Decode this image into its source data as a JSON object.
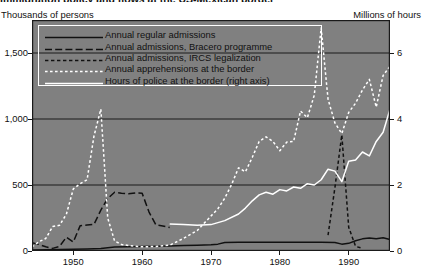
{
  "figure": {
    "title_partial": "Immigration policy and flows at the US-Mexican border",
    "left_axis_caption": "Thousands of persons",
    "right_axis_caption": "Millions of hours",
    "plot_background": "#808080",
    "gridline_color": "#1a1a1a",
    "frame_color": "#1a1a1a"
  },
  "legend": {
    "border_color": "#ffffff",
    "items": [
      {
        "label": "Annual regular admissions",
        "style": "solid",
        "color": "#111111",
        "width": 1.6
      },
      {
        "label": "Annual admissions, Bracero programme",
        "style": "long-dash",
        "color": "#111111",
        "width": 1.6
      },
      {
        "label": "Annual admissions, IRCS legalization",
        "style": "short-dash",
        "color": "#111111",
        "width": 1.6
      },
      {
        "label": "Annual apprehensions at the border",
        "style": "dotted",
        "color": "#ffffff",
        "width": 1.6
      },
      {
        "label": "Hours of police at the border (right axis)",
        "style": "solid",
        "color": "#ffffff",
        "width": 1.6
      }
    ]
  },
  "chart_data": {
    "type": "line",
    "title": "Immigration policy and flows at the US-Mexican border",
    "xlabel": "",
    "ylabel": "Thousands of persons",
    "y2label": "Millions of hours",
    "xlim": [
      1944,
      1996
    ],
    "ylim": [
      0,
      1750
    ],
    "y2lim": [
      0,
      7
    ],
    "grid": true,
    "legend_position": "top-left-inside",
    "xticks": [
      1950,
      1960,
      1970,
      1980,
      1990
    ],
    "xtick_labels": [
      "1950",
      "1960",
      "1970",
      "1980",
      "1990"
    ],
    "yticks": [
      0,
      500,
      1000,
      1500
    ],
    "ytick_labels": [
      "0",
      "500",
      "1,000",
      "1,500"
    ],
    "y2ticks": [
      0,
      2,
      4,
      6
    ],
    "y2tick_labels": [
      "0",
      "2",
      "4",
      "6"
    ],
    "series": [
      {
        "name": "Annual regular admissions",
        "axis": "left",
        "style": "solid",
        "color": "#111111",
        "points": [
          [
            1944,
            8
          ],
          [
            1946,
            10
          ],
          [
            1948,
            12
          ],
          [
            1950,
            14
          ],
          [
            1952,
            16
          ],
          [
            1954,
            18
          ],
          [
            1956,
            30
          ],
          [
            1958,
            32
          ],
          [
            1960,
            34
          ],
          [
            1962,
            36
          ],
          [
            1964,
            38
          ],
          [
            1966,
            42
          ],
          [
            1968,
            44
          ],
          [
            1970,
            48
          ],
          [
            1971,
            52
          ],
          [
            1972,
            64
          ],
          [
            1974,
            66
          ],
          [
            1976,
            66
          ],
          [
            1978,
            66
          ],
          [
            1980,
            66
          ],
          [
            1982,
            66
          ],
          [
            1984,
            66
          ],
          [
            1986,
            66
          ],
          [
            1988,
            64
          ],
          [
            1989,
            52
          ],
          [
            1990,
            58
          ],
          [
            1991,
            78
          ],
          [
            1992,
            92
          ],
          [
            1993,
            98
          ],
          [
            1994,
            92
          ],
          [
            1995,
            100
          ],
          [
            1996,
            86
          ]
        ]
      },
      {
        "name": "Annual admissions, Bracero programme",
        "axis": "left",
        "style": "long-dash",
        "color": "#111111",
        "points": [
          [
            1944,
            62
          ],
          [
            1945,
            50
          ],
          [
            1946,
            32
          ],
          [
            1947,
            20
          ],
          [
            1948,
            35
          ],
          [
            1949,
            105
          ],
          [
            1950,
            68
          ],
          [
            1951,
            192
          ],
          [
            1952,
            197
          ],
          [
            1953,
            201
          ],
          [
            1954,
            310
          ],
          [
            1955,
            398
          ],
          [
            1956,
            445
          ],
          [
            1957,
            437
          ],
          [
            1958,
            433
          ],
          [
            1959,
            440
          ],
          [
            1960,
            437
          ],
          [
            1961,
            295
          ],
          [
            1962,
            198
          ],
          [
            1963,
            190
          ],
          [
            1964,
            178
          ]
        ]
      },
      {
        "name": "Annual admissions, IRCS legalization",
        "axis": "left",
        "style": "short-dash",
        "color": "#111111",
        "points": [
          [
            1987,
            120
          ],
          [
            1988,
            480
          ],
          [
            1989,
            880
          ],
          [
            1990,
            180
          ],
          [
            1991,
            35
          ],
          [
            1992,
            20
          ]
        ]
      },
      {
        "name": "Annual apprehensions at the border",
        "axis": "left",
        "style": "dotted",
        "color": "#ffffff",
        "points": [
          [
            1944,
            30
          ],
          [
            1945,
            70
          ],
          [
            1946,
            95
          ],
          [
            1947,
            185
          ],
          [
            1948,
            195
          ],
          [
            1949,
            280
          ],
          [
            1950,
            470
          ],
          [
            1951,
            510
          ],
          [
            1952,
            540
          ],
          [
            1953,
            870
          ],
          [
            1954,
            1075
          ],
          [
            1955,
            250
          ],
          [
            1956,
            75
          ],
          [
            1957,
            50
          ],
          [
            1958,
            42
          ],
          [
            1960,
            32
          ],
          [
            1962,
            34
          ],
          [
            1964,
            44
          ],
          [
            1966,
            95
          ],
          [
            1968,
            155
          ],
          [
            1970,
            265
          ],
          [
            1971,
            320
          ],
          [
            1972,
            400
          ],
          [
            1973,
            505
          ],
          [
            1974,
            630
          ],
          [
            1975,
            600
          ],
          [
            1976,
            710
          ],
          [
            1977,
            830
          ],
          [
            1978,
            865
          ],
          [
            1979,
            830
          ],
          [
            1980,
            760
          ],
          [
            1981,
            825
          ],
          [
            1982,
            830
          ],
          [
            1983,
            1060
          ],
          [
            1984,
            1010
          ],
          [
            1985,
            1180
          ],
          [
            1986,
            1690
          ],
          [
            1987,
            1150
          ],
          [
            1988,
            970
          ],
          [
            1989,
            890
          ],
          [
            1990,
            1050
          ],
          [
            1991,
            1120
          ],
          [
            1992,
            1220
          ],
          [
            1993,
            1300
          ],
          [
            1994,
            1090
          ],
          [
            1995,
            1330
          ],
          [
            1996,
            1400
          ]
        ]
      },
      {
        "name": "Hours of police at the border (right axis)",
        "axis": "right",
        "style": "solid",
        "color": "#ffffff",
        "points": [
          [
            1964,
            0.82
          ],
          [
            1966,
            0.8
          ],
          [
            1968,
            0.78
          ],
          [
            1970,
            0.8
          ],
          [
            1972,
            0.92
          ],
          [
            1974,
            1.12
          ],
          [
            1975,
            1.3
          ],
          [
            1976,
            1.52
          ],
          [
            1977,
            1.7
          ],
          [
            1978,
            1.78
          ],
          [
            1979,
            1.72
          ],
          [
            1980,
            1.86
          ],
          [
            1981,
            1.82
          ],
          [
            1982,
            1.94
          ],
          [
            1983,
            1.9
          ],
          [
            1984,
            2.04
          ],
          [
            1985,
            2.0
          ],
          [
            1986,
            2.16
          ],
          [
            1987,
            2.48
          ],
          [
            1988,
            2.42
          ],
          [
            1989,
            2.1
          ],
          [
            1990,
            2.72
          ],
          [
            1991,
            2.76
          ],
          [
            1992,
            3.0
          ],
          [
            1993,
            2.88
          ],
          [
            1994,
            3.32
          ],
          [
            1995,
            3.6
          ],
          [
            1996,
            4.3
          ]
        ]
      }
    ]
  }
}
